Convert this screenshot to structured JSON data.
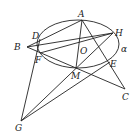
{
  "diagram": {
    "plane_label": "α",
    "points": {
      "A": {
        "label": "A",
        "x": 82,
        "y": 20
      },
      "B": {
        "label": "B",
        "x": 27,
        "y": 47
      },
      "C": {
        "label": "C",
        "x": 125,
        "y": 89
      },
      "D": {
        "label": "D",
        "x": 40,
        "y": 39
      },
      "E": {
        "label": "E",
        "x": 110,
        "y": 62
      },
      "F": {
        "label": "F",
        "x": 40,
        "y": 53
      },
      "G": {
        "label": "G",
        "x": 21,
        "y": 121
      },
      "H": {
        "label": "H",
        "x": 113,
        "y": 33
      },
      "M": {
        "label": "M",
        "x": 76,
        "y": 68
      },
      "O": {
        "label": "O",
        "x": 79,
        "y": 45
      }
    },
    "ellipse": {
      "cx": 78,
      "cy": 44,
      "rx": 41,
      "ry": 24
    },
    "segments": [
      [
        "B",
        "A"
      ],
      [
        "B",
        "H"
      ],
      [
        "B",
        "C"
      ],
      [
        "F",
        "H"
      ],
      [
        "A",
        "M"
      ],
      [
        "A",
        "C"
      ],
      [
        "D",
        "G"
      ],
      [
        "G",
        "H"
      ],
      [
        "G",
        "E"
      ]
    ]
  }
}
